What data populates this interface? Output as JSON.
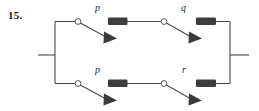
{
  "figure": {
    "number_label": "15.",
    "type": "switching-circuit-diagram",
    "colors": {
      "wire": "#4a4a4a",
      "block_fill": "#3d3d3d",
      "pivot_stroke": "#555555",
      "pivot_fill": "#ffffff",
      "text": "#1a1a1a",
      "background": "#ffffff"
    },
    "branches": [
      {
        "name": "top-branch",
        "switches": [
          {
            "label": "p",
            "state": "open",
            "position": "top-left"
          },
          {
            "label": "q",
            "state": "open",
            "position": "top-right"
          }
        ],
        "blocks": 2
      },
      {
        "name": "bottom-branch",
        "switches": [
          {
            "label": "p",
            "state": "open",
            "position": "bottom-left"
          },
          {
            "label": "r",
            "state": "open",
            "position": "bottom-right"
          }
        ],
        "blocks": 2
      }
    ],
    "labels": {
      "top_left_switch": "p",
      "top_right_switch": "q",
      "bottom_left_switch": "p",
      "bottom_right_switch": "r"
    },
    "terminals": {
      "left": "input-terminal",
      "right": "output-terminal"
    }
  }
}
